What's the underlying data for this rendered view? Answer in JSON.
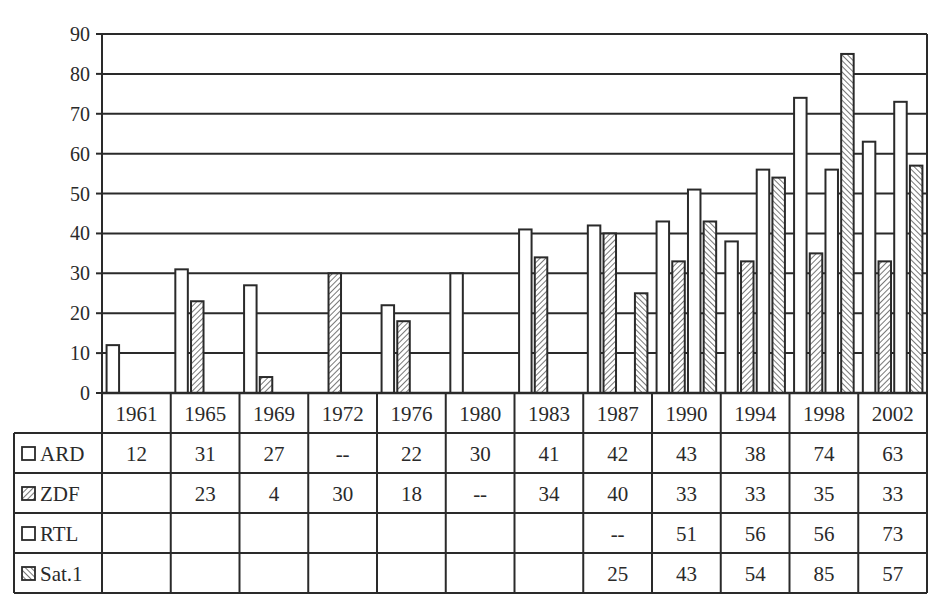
{
  "chart_data": {
    "type": "bar",
    "title": "",
    "xlabel": "",
    "ylabel": "",
    "ylim": [
      0,
      90
    ],
    "yticks": [
      0,
      10,
      20,
      30,
      40,
      50,
      60,
      70,
      80,
      90
    ],
    "grid": true,
    "legend_position": "data-table-left",
    "categories": [
      "1961",
      "1965",
      "1969",
      "1972",
      "1976",
      "1980",
      "1983",
      "1987",
      "1990",
      "1994",
      "1998",
      "2002"
    ],
    "series": [
      {
        "name": "ARD",
        "pattern": "white",
        "values": [
          12,
          31,
          27,
          null,
          22,
          30,
          41,
          42,
          43,
          38,
          74,
          63
        ],
        "table": [
          "12",
          "31",
          "27",
          "--",
          "22",
          "30",
          "41",
          "42",
          "43",
          "38",
          "74",
          "63"
        ]
      },
      {
        "name": "ZDF",
        "pattern": "hatch-right",
        "values": [
          null,
          23,
          4,
          30,
          18,
          null,
          34,
          40,
          33,
          33,
          35,
          33
        ],
        "table": [
          "",
          "23",
          "4",
          "30",
          "18",
          "--",
          "34",
          "40",
          "33",
          "33",
          "35",
          "33"
        ]
      },
      {
        "name": "RTL",
        "pattern": "white",
        "values": [
          null,
          null,
          null,
          null,
          null,
          null,
          null,
          null,
          51,
          56,
          56,
          73
        ],
        "table": [
          "",
          "",
          "",
          "",
          "",
          "",
          "",
          "--",
          "51",
          "56",
          "56",
          "73"
        ]
      },
      {
        "name": "Sat.1",
        "pattern": "hatch-left",
        "values": [
          null,
          null,
          null,
          null,
          null,
          null,
          null,
          25,
          43,
          54,
          85,
          57
        ],
        "table": [
          "",
          "",
          "",
          "",
          "",
          "",
          "",
          "25",
          "43",
          "54",
          "85",
          "57"
        ]
      }
    ]
  },
  "colors": {
    "line": "#2a2a2a",
    "bar_fill": "#ffffff",
    "hatch": "#555555",
    "background": "#ffffff"
  }
}
